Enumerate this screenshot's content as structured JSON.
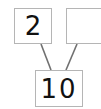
{
  "number_bond": {
    "whole": "10",
    "parts": [
      "2",
      ""
    ],
    "line_color": "#707070",
    "border_color": "#b5b5b5"
  }
}
